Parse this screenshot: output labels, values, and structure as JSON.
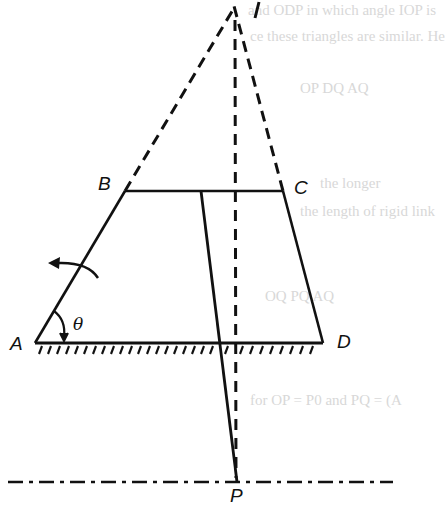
{
  "figure": {
    "labels": {
      "I": "I",
      "B": "B",
      "C": "C",
      "A": "A",
      "D": "D",
      "P": "P",
      "theta": "θ"
    },
    "points": {
      "I": [
        259,
        8
      ],
      "B": [
        125,
        191
      ],
      "C": [
        283,
        191
      ],
      "A": [
        35,
        343
      ],
      "D": [
        323,
        343
      ],
      "O_top": [
        201,
        191
      ],
      "O_base": [
        219,
        343
      ],
      "P": [
        237,
        482
      ]
    },
    "elements": [
      "solid link AB",
      "solid link BC",
      "solid link CD",
      "fixed ground AD with hatching",
      "solid line from BC through base to P",
      "dashed extension of AB to I",
      "dashed extension of DC to I",
      "dashed vertical from I to P",
      "dash-dot horizontal reference line through P",
      "curved rotation arrow on AB (counter-clockwise)",
      "angle arc θ at A"
    ],
    "colors": {
      "ink": "#111111",
      "background": "#ffffff",
      "ghost_text": "#d8d8d8"
    }
  },
  "ghost_text": {
    "line1": "and ODP in which angle IOP is",
    "line2": "ce these triangles are similar. He",
    "line3": "OP    DQ    AQ",
    "line4": "the longer",
    "line5": "the length of rigid link",
    "line6": "OQ    PQ    AQ",
    "line7": "for OP = P0 and PQ = (A"
  }
}
